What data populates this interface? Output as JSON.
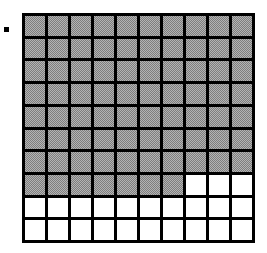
{
  "figure": {
    "type": "shaded-grid",
    "title": "",
    "bullet_marker": "square-bullet",
    "canvas": {
      "width": 267,
      "height": 253,
      "background_color": "#ffffff"
    },
    "grid": {
      "rows": 10,
      "columns": 10,
      "total_cells": 100,
      "shaded_cells": 77,
      "unshaded_cells": 23,
      "line_color": "#000000",
      "line_width": 3,
      "shaded_color": "#b4b4b4",
      "unshaded_color": "#ffffff",
      "shaded_fill_style": "dither-halftone",
      "origin_x": 22,
      "origin_y": 13,
      "width": 233,
      "height": 230,
      "row_shaded_counts": [
        10,
        10,
        10,
        10,
        10,
        10,
        10,
        7,
        0,
        0
      ],
      "cells": [
        [
          1,
          1,
          1,
          1,
          1,
          1,
          1,
          1,
          1,
          1
        ],
        [
          1,
          1,
          1,
          1,
          1,
          1,
          1,
          1,
          1,
          1
        ],
        [
          1,
          1,
          1,
          1,
          1,
          1,
          1,
          1,
          1,
          1
        ],
        [
          1,
          1,
          1,
          1,
          1,
          1,
          1,
          1,
          1,
          1
        ],
        [
          1,
          1,
          1,
          1,
          1,
          1,
          1,
          1,
          1,
          1
        ],
        [
          1,
          1,
          1,
          1,
          1,
          1,
          1,
          1,
          1,
          1
        ],
        [
          1,
          1,
          1,
          1,
          1,
          1,
          1,
          1,
          1,
          1
        ],
        [
          1,
          1,
          1,
          1,
          1,
          1,
          1,
          0,
          0,
          0
        ],
        [
          0,
          0,
          0,
          0,
          0,
          0,
          0,
          0,
          0,
          0
        ],
        [
          0,
          0,
          0,
          0,
          0,
          0,
          0,
          0,
          0,
          0
        ]
      ]
    }
  },
  "chart_data": {
    "type": "heatmap",
    "title": "",
    "subtitle": "",
    "xlabel": "",
    "ylabel": "",
    "grid": true,
    "legend": null,
    "rows": 10,
    "columns": 10,
    "x": [
      1,
      2,
      3,
      4,
      5,
      6,
      7,
      8,
      9,
      10
    ],
    "y": [
      1,
      2,
      3,
      4,
      5,
      6,
      7,
      8,
      9,
      10
    ],
    "values": [
      [
        1,
        1,
        1,
        1,
        1,
        1,
        1,
        1,
        1,
        1
      ],
      [
        1,
        1,
        1,
        1,
        1,
        1,
        1,
        1,
        1,
        1
      ],
      [
        1,
        1,
        1,
        1,
        1,
        1,
        1,
        1,
        1,
        1
      ],
      [
        1,
        1,
        1,
        1,
        1,
        1,
        1,
        1,
        1,
        1
      ],
      [
        1,
        1,
        1,
        1,
        1,
        1,
        1,
        1,
        1,
        1
      ],
      [
        1,
        1,
        1,
        1,
        1,
        1,
        1,
        1,
        1,
        1
      ],
      [
        1,
        1,
        1,
        1,
        1,
        1,
        1,
        1,
        1,
        1
      ],
      [
        1,
        1,
        1,
        1,
        1,
        1,
        1,
        0,
        0,
        0
      ],
      [
        0,
        0,
        0,
        0,
        0,
        0,
        0,
        0,
        0,
        0
      ],
      [
        0,
        0,
        0,
        0,
        0,
        0,
        0,
        0,
        0,
        0
      ]
    ],
    "value_labels": {
      "0": "unshaded",
      "1": "shaded"
    },
    "colors": {
      "0": "#ffffff",
      "1": "#b4b4b4"
    },
    "shaded_count": 77,
    "unshaded_count": 23,
    "fraction_shaded": "77/100",
    "annotations": []
  }
}
